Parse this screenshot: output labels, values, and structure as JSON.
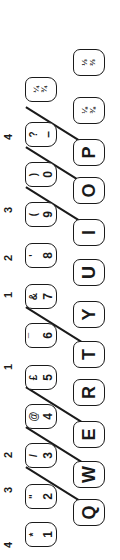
{
  "finger_labels": [
    {
      "value": "4",
      "x": 8
    },
    {
      "value": "3",
      "x": 63
    },
    {
      "value": "2",
      "x": 98
    },
    {
      "value": "1",
      "x": 186
    },
    {
      "value": "1",
      "x": 258
    },
    {
      "value": "2",
      "x": 295
    },
    {
      "value": "3",
      "x": 343
    },
    {
      "value": "4",
      "x": 416
    }
  ],
  "number_row": [
    {
      "shift": "*",
      "main": "1"
    },
    {
      "shift": "\"",
      "main": "2"
    },
    {
      "shift": "/",
      "main": "3"
    },
    {
      "shift": "@",
      "main": "4"
    },
    {
      "shift": "£",
      "main": "5"
    },
    {
      "shift": "¯",
      "main": "6"
    },
    {
      "shift": "&",
      "main": "7"
    },
    {
      "shift": "'",
      "main": "8"
    },
    {
      "shift": "(",
      "main": "9"
    },
    {
      "shift": ")",
      "main": "0"
    },
    {
      "shift": "?",
      "main": "–"
    },
    {
      "shift": "¼",
      "main": "¾"
    }
  ],
  "letter_row": [
    {
      "label": "Q"
    },
    {
      "label": "W"
    },
    {
      "label": "E"
    },
    {
      "label": "R"
    },
    {
      "label": "T"
    },
    {
      "label": "Y"
    },
    {
      "label": "U"
    },
    {
      "label": "I"
    },
    {
      "label": "O"
    },
    {
      "label": "P"
    },
    {
      "shift": "⅛",
      "main": "⅜"
    },
    {
      "shift": "⅓",
      "main": "⅔"
    }
  ],
  "colors": {
    "ink": "#1a1a1a",
    "background": "#ffffff"
  }
}
